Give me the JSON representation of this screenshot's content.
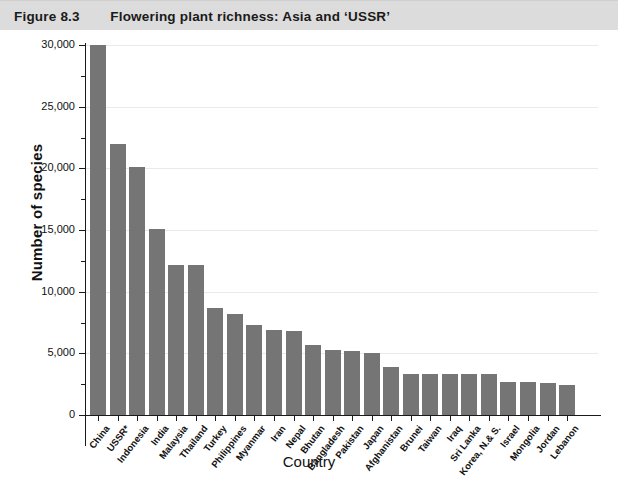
{
  "caption": {
    "figure_number": "Figure 8.3",
    "figure_title": "Flowering plant richness: Asia and ‘USSR’"
  },
  "chart_data": {
    "type": "bar",
    "title": "Flowering plant richness: Asia and ‘USSR’",
    "xlabel": "Country",
    "ylabel": "Number of species",
    "ylim": [
      0,
      30000
    ],
    "ytick_values": [
      0,
      5000,
      10000,
      15000,
      20000,
      25000,
      30000
    ],
    "ytick_labels": [
      "0",
      "5,000",
      "10,000",
      "15,000",
      "20,000",
      "25,000",
      "30,000"
    ],
    "yminor_values": [
      2500,
      7500,
      12500,
      17500,
      22500,
      27500
    ],
    "grid": "horizontal-major",
    "legend": "none",
    "bar_color": "#757575",
    "categories": [
      "China",
      "USSR*",
      "Indonesia",
      "India",
      "Malaysia",
      "Thailand",
      "Turkey",
      "Philippines",
      "Myanmar",
      "Iran",
      "Nepal",
      "Bhutan",
      "Bangladesh",
      "Pakistan",
      "Japan",
      "Afghanistan",
      "Brunei",
      "Taiwan",
      "Iraq",
      "Sri Lanka",
      "Korea, N.& S.",
      "Israel",
      "Mongolia",
      "Jordan",
      "Lebanon"
    ],
    "values": [
      30000,
      22000,
      20100,
      15100,
      12150,
      12150,
      8650,
      8200,
      7300,
      6900,
      6850,
      5700,
      5300,
      5200,
      5000,
      3900,
      3350,
      3300,
      3300,
      3300,
      3300,
      2700,
      2650,
      2600,
      2400
    ]
  }
}
